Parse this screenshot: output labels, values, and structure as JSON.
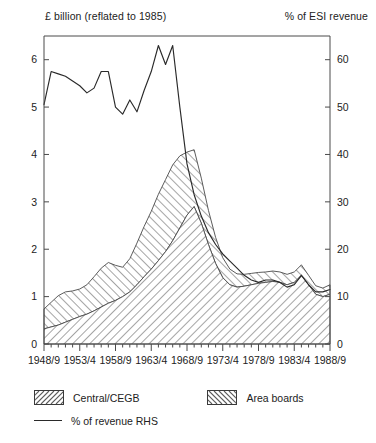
{
  "header": {
    "left_axis_title": "£ billion (reflated to 1985)",
    "right_axis_title": "% of ESI revenue"
  },
  "legend": {
    "items": [
      {
        "label": "Central/CEGB",
        "marker": "hatch-forward-swatch"
      },
      {
        "label": "Area boards",
        "marker": "hatch-backward-swatch"
      },
      {
        "label": "% of revenue RHS",
        "marker": "line-swatch"
      }
    ]
  },
  "colors": {
    "axis": "#4a4a4a",
    "line": "#2a2a2a",
    "hatch": "#5a5a5a",
    "text": "#222222",
    "background": "#ffffff"
  },
  "chart_data": {
    "type": "area",
    "title": "",
    "subtitle": "",
    "xlabel": "",
    "ylabel": "£ billion (reflated to 1985)",
    "y2label": "% of ESI revenue",
    "grid": false,
    "legend_position": "bottom-left",
    "x": [
      "1948/9",
      "1949/50",
      "1950/1",
      "1951/2",
      "1952/3",
      "1953/4",
      "1954/5",
      "1955/6",
      "1956/7",
      "1957/8",
      "1958/9",
      "1959/60",
      "1960/1",
      "1961/2",
      "1962/3",
      "1963/4",
      "1964/5",
      "1965/6",
      "1966/7",
      "1967/8",
      "1968/9",
      "1969/70",
      "1970/1",
      "1971/2",
      "1972/3",
      "1973/4",
      "1974/5",
      "1975/6",
      "1976/7",
      "1977/8",
      "1978/9",
      "1979/80",
      "1980/1",
      "1981/2",
      "1982/3",
      "1983/4",
      "1984/5",
      "1985/6",
      "1986/7",
      "1987/8",
      "1988/9"
    ],
    "xtick_labels": [
      "1948/9",
      "1953/4",
      "1958/9",
      "1963/4",
      "1968/9",
      "1973/4",
      "1978/9",
      "1983/4",
      "1988/9"
    ],
    "xtick_indices": [
      0,
      5,
      10,
      15,
      20,
      25,
      30,
      35,
      40
    ],
    "ylim": [
      0,
      6.5
    ],
    "ytick_values": [
      0,
      1,
      2,
      3,
      4,
      5,
      6
    ],
    "y2lim": [
      0,
      65
    ],
    "y2tick_values": [
      0,
      10,
      20,
      30,
      40,
      50,
      60
    ],
    "stacked": true,
    "series": [
      {
        "name": "Central/CEGB",
        "axis": "left",
        "units": "£ billion (reflated to 1985)",
        "fill": "hatch-forward",
        "values": [
          0.32,
          0.36,
          0.4,
          0.46,
          0.52,
          0.58,
          0.63,
          0.7,
          0.78,
          0.86,
          0.92,
          1.0,
          1.1,
          1.25,
          1.42,
          1.58,
          1.76,
          1.95,
          2.18,
          2.45,
          2.72,
          2.9,
          2.55,
          2.1,
          1.7,
          1.4,
          1.25,
          1.2,
          1.22,
          1.25,
          1.28,
          1.3,
          1.32,
          1.3,
          1.25,
          1.3,
          1.45,
          1.25,
          1.05,
          1.0,
          1.05
        ]
      },
      {
        "name": "Area boards",
        "axis": "left",
        "units": "£ billion (reflated to 1985)",
        "fill": "hatch-backward",
        "values": [
          0.42,
          0.52,
          0.62,
          0.64,
          0.6,
          0.58,
          0.62,
          0.72,
          0.82,
          0.86,
          0.74,
          0.62,
          0.7,
          0.88,
          1.06,
          1.22,
          1.4,
          1.52,
          1.6,
          1.52,
          1.33,
          1.2,
          0.95,
          0.72,
          0.55,
          0.42,
          0.33,
          0.28,
          0.25,
          0.24,
          0.23,
          0.22,
          0.22,
          0.22,
          0.22,
          0.22,
          0.22,
          0.2,
          0.18,
          0.18,
          0.2
        ]
      },
      {
        "name": "% of revenue RHS",
        "axis": "right",
        "units": "% of ESI revenue",
        "type": "line",
        "values": [
          50.5,
          57.5,
          57.0,
          56.5,
          55.5,
          54.5,
          53.0,
          54.0,
          57.5,
          57.5,
          50.0,
          48.5,
          51.5,
          49.0,
          53.5,
          57.5,
          63.0,
          59.0,
          63.0,
          50.0,
          38.0,
          31.5,
          27.0,
          23.5,
          21.0,
          19.0,
          17.5,
          16.0,
          14.5,
          13.5,
          13.0,
          13.5,
          13.5,
          13.0,
          12.0,
          12.5,
          14.5,
          12.5,
          11.0,
          11.0,
          11.5
        ]
      }
    ]
  }
}
